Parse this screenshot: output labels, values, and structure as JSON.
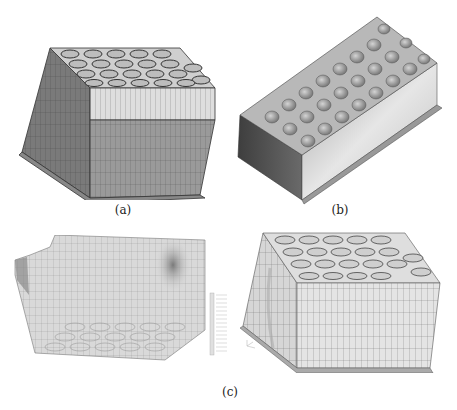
{
  "figure": {
    "captions": {
      "a": "(a)",
      "b": "(b)",
      "c": "(c)"
    },
    "panels": [
      {
        "id": "a",
        "description": "FE mesh of honeycomb core sandwich block, shaded faces"
      },
      {
        "id": "b",
        "description": "Rendered solid model of honeycomb cellular block"
      },
      {
        "id": "c-left",
        "description": "Deformed FE mesh with contour shading and legend"
      },
      {
        "id": "c-right",
        "description": "Deformed FE mesh of honeycomb block, light shading"
      }
    ],
    "colors": {
      "mesh_line": "#3a3a3a",
      "face_light": "#d8d8d8",
      "face_mid": "#9a9a9a",
      "face_dark": "#6e6e6e",
      "render_light": "#d0d0d0",
      "render_dark": "#5a5a5a"
    }
  }
}
